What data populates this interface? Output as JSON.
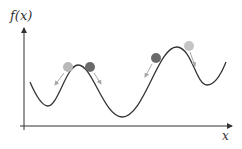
{
  "diagram": {
    "type": "function-landscape",
    "y_axis_label": "f(x)",
    "x_axis_label": "x",
    "colors": {
      "axis": "#333333",
      "curve": "#333333",
      "ball_light": "#b9b9b9",
      "ball_dark": "#6a6a6a",
      "arrow": "#a8a8a8"
    },
    "curve_points": [
      [
        30,
        82
      ],
      [
        48,
        106
      ],
      [
        78,
        65
      ],
      [
        122,
        117
      ],
      [
        178,
        47
      ],
      [
        207,
        85
      ],
      [
        226,
        62
      ]
    ],
    "balls": [
      {
        "shade": "light",
        "cx": 68,
        "cy": 67,
        "direction": "left-down"
      },
      {
        "shade": "dark",
        "cx": 90,
        "cy": 67,
        "direction": "right-down"
      },
      {
        "shade": "dark",
        "cx": 156,
        "cy": 58,
        "direction": "left-down"
      },
      {
        "shade": "light",
        "cx": 189,
        "cy": 46,
        "direction": "right-down"
      }
    ]
  }
}
